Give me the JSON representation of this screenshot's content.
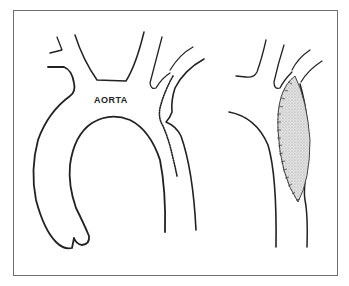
{
  "figure": {
    "label_aorta": "AORTA",
    "caption": "",
    "colors": {
      "line": "#222222",
      "frame": "#6e6e6e",
      "patch_fill": "#d6d6d6",
      "background": "#ffffff"
    },
    "panels": [
      {
        "name": "before-repair",
        "description": "Aortic arch with branch vessels; dotted incision line along narrowed segment (coarctation)"
      },
      {
        "name": "after-repair",
        "description": "Descending aorta with elliptical patch graft sutured in place"
      }
    ]
  }
}
